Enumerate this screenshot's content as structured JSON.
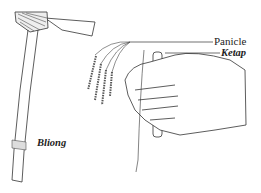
{
  "figure": {
    "labels": {
      "panicle": "Panicle",
      "ketap": "Ketap",
      "bliong": "Bliong"
    },
    "colors": {
      "ink": "#333333",
      "background": "#ffffff"
    }
  }
}
